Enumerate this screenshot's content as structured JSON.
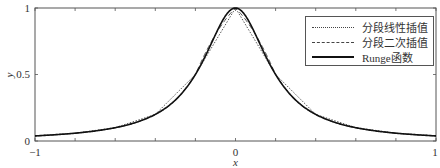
{
  "chart_data": {
    "type": "line",
    "title": "",
    "xlabel": "x",
    "ylabel": "y",
    "xlim": [
      -1,
      1
    ],
    "ylim": [
      0,
      1
    ],
    "x_ticks": [
      -1,
      -0.8,
      -0.6,
      -0.4,
      -0.2,
      0,
      0.2,
      0.4,
      0.6,
      0.8,
      1
    ],
    "x_tick_labels": [
      "-1",
      "",
      "",
      "",
      "",
      "0",
      "",
      "",
      "",
      "",
      "1"
    ],
    "y_ticks": [
      0,
      0.5,
      1
    ],
    "y_tick_labels": [
      "0",
      "0.5",
      "1"
    ],
    "grid": false,
    "legend_position": "upper right",
    "series": [
      {
        "name": "分段线性插值",
        "style": "dotted",
        "color": "#444444",
        "x": [
          -1,
          -0.8,
          -0.6,
          -0.4,
          -0.2,
          0,
          0.2,
          0.4,
          0.6,
          0.8,
          1
        ],
        "values": [
          0.0385,
          0.0588,
          0.1,
          0.2,
          0.5,
          1,
          0.5,
          0.2,
          0.1,
          0.0588,
          0.0385
        ]
      },
      {
        "name": "分段二次插值",
        "style": "dashed",
        "color": "#444444",
        "x": [
          -1,
          -0.8,
          -0.6,
          -0.4,
          -0.2,
          0,
          0.2,
          0.4,
          0.6,
          0.8,
          1
        ],
        "values": [
          0.0385,
          0.0588,
          0.1,
          0.2,
          0.5,
          1,
          0.5,
          0.2,
          0.1,
          0.0588,
          0.0385
        ]
      },
      {
        "name": "Runge函数",
        "style": "solid",
        "color": "#111111",
        "formula": "1/(1+25x^2)",
        "x": [
          -1,
          -0.8,
          -0.6,
          -0.4,
          -0.2,
          0,
          0.2,
          0.4,
          0.6,
          0.8,
          1
        ],
        "values": [
          0.0385,
          0.0588,
          0.1,
          0.2,
          0.5,
          1,
          0.5,
          0.2,
          0.1,
          0.0588,
          0.0385
        ]
      }
    ]
  },
  "legend": {
    "items": [
      {
        "label": "分段线性插值",
        "style": "dotted"
      },
      {
        "label": "分段二次插值",
        "style": "dashed"
      },
      {
        "label": "Runge函数",
        "style": "solid"
      }
    ]
  },
  "axes": {
    "x_label": "x",
    "y_label": "y",
    "x_tick_left": "−1",
    "x_tick_mid": "0",
    "x_tick_right": "1",
    "y_tick_bottom": "0",
    "y_tick_mid": "0.5",
    "y_tick_top": "1"
  }
}
